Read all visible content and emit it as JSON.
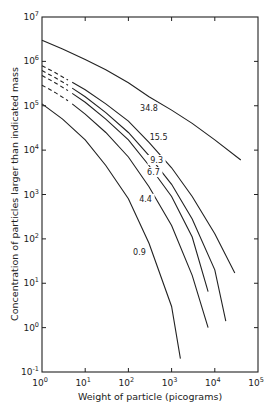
{
  "chart_data": {
    "type": "line",
    "title": "",
    "xlabel": "Weight of particle (picograms)",
    "ylabel": "Concentration of particles larger than indicated mass",
    "xscale": "log",
    "yscale": "log",
    "xlim": [
      1,
      100000
    ],
    "ylim": [
      0.1,
      10000000
    ],
    "grid": false,
    "legend": "inline curve labels",
    "x_ticks": [
      {
        "base": "10",
        "exp": "0"
      },
      {
        "base": "10",
        "exp": "1"
      },
      {
        "base": "10",
        "exp": "2"
      },
      {
        "base": "10",
        "exp": "3"
      },
      {
        "base": "10",
        "exp": "4"
      },
      {
        "base": "10",
        "exp": "5"
      }
    ],
    "y_ticks": [
      {
        "base": "10",
        "exp": "-1"
      },
      {
        "base": "10",
        "exp": "0"
      },
      {
        "base": "10",
        "exp": "1"
      },
      {
        "base": "10",
        "exp": "2"
      },
      {
        "base": "10",
        "exp": "3"
      },
      {
        "base": "10",
        "exp": "4"
      },
      {
        "base": "10",
        "exp": "5"
      },
      {
        "base": "10",
        "exp": "6"
      },
      {
        "base": "10",
        "exp": "7"
      }
    ],
    "series": [
      {
        "name": "34.8",
        "dashed_x": [],
        "dashed_y": [],
        "x": [
          1,
          3,
          10,
          30,
          100,
          300,
          1000,
          3000,
          10000,
          40000
        ],
        "y": [
          3000000,
          1900000,
          1100000,
          650000,
          330000,
          160000,
          80000,
          40000,
          17000,
          6000
        ],
        "label_at": [
          300,
          90000
        ]
      },
      {
        "name": "15.5",
        "dashed_x": [
          1,
          2,
          4
        ],
        "dashed_y": [
          800000,
          560000,
          380000
        ],
        "x": [
          5,
          10,
          30,
          100,
          300,
          1000,
          3000,
          10000,
          29000
        ],
        "y": [
          340000,
          230000,
          110000,
          45000,
          15000,
          4000,
          900,
          130,
          17
        ],
        "label_at": [
          500,
          20000
        ]
      },
      {
        "name": "9.3",
        "dashed_x": [
          1,
          2,
          4
        ],
        "dashed_y": [
          620000,
          430000,
          290000
        ],
        "x": [
          5,
          10,
          30,
          100,
          300,
          1000,
          3000,
          10000,
          18000
        ],
        "y": [
          250000,
          160000,
          70000,
          25000,
          7500,
          1700,
          280,
          20,
          1.4
        ],
        "label_at": [
          450,
          6000
        ]
      },
      {
        "name": "6.7",
        "dashed_x": [
          1,
          2,
          4
        ],
        "dashed_y": [
          480000,
          330000,
          220000
        ],
        "x": [
          5,
          10,
          30,
          100,
          300,
          1000,
          3000,
          7000
        ],
        "y": [
          190000,
          120000,
          50000,
          17000,
          4500,
          900,
          110,
          6.5
        ],
        "label_at": [
          380,
          3200
        ]
      },
      {
        "name": "4.4",
        "dashed_x": [
          1,
          2,
          4
        ],
        "dashed_y": [
          290000,
          200000,
          130000
        ],
        "x": [
          5,
          10,
          30,
          100,
          300,
          1000,
          3000,
          7000
        ],
        "y": [
          110000,
          65000,
          25000,
          7000,
          1500,
          200,
          15,
          1
        ],
        "label_at": [
          250,
          800
        ]
      },
      {
        "name": "0.9",
        "dashed_x": [],
        "dashed_y": [],
        "x": [
          1,
          3,
          10,
          30,
          100,
          300,
          1000,
          1600
        ],
        "y": [
          110000,
          50000,
          17000,
          4500,
          800,
          80,
          3,
          0.2
        ],
        "label_at": [
          180,
          50
        ]
      }
    ]
  }
}
